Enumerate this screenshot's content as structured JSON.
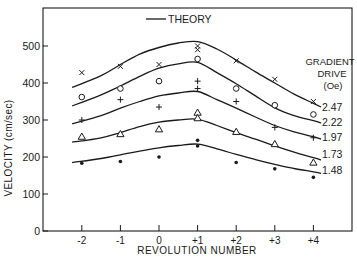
{
  "chart_data": {
    "type": "line",
    "title": "",
    "xlabel": "REVOLUTION NUMBER",
    "ylabel": "VELOCITY (cm/sec)",
    "x": [
      -2,
      -1,
      0,
      1,
      2,
      3,
      4
    ],
    "x_tick_labels": [
      "-2",
      "-1",
      "0",
      "+1",
      "+2",
      "+3",
      "+4"
    ],
    "y_ticks": [
      0,
      100,
      200,
      300,
      400,
      500
    ],
    "y_tick_labels": [
      "0",
      "100",
      "200",
      "300",
      "400",
      "500"
    ],
    "ylim": [
      0,
      590
    ],
    "xlim": [
      -3,
      5
    ],
    "grid": false,
    "legend": {
      "position": "top-center",
      "entries": [
        "THEORY"
      ],
      "series_label_title": [
        "GRADIENT",
        "DRIVE",
        "(Oe)"
      ]
    },
    "series": [
      {
        "name": "2.47",
        "marker": "x",
        "measured": [
          [
            -2,
            428
          ],
          [
            -1,
            445
          ],
          [
            0,
            450
          ],
          [
            1,
            500
          ],
          [
            1,
            490
          ],
          [
            2,
            460
          ],
          [
            3,
            410
          ],
          [
            4,
            350
          ]
        ],
        "theory_x": [
          -2.25,
          -1.5,
          -1,
          -0.5,
          0,
          0.5,
          1,
          1.5,
          2,
          2.5,
          3,
          3.5,
          4,
          4.2
        ],
        "theory_y": [
          388,
          420,
          450,
          478,
          496,
          508,
          512,
          492,
          462,
          430,
          400,
          370,
          345,
          335
        ]
      },
      {
        "name": "2.22",
        "marker": "o",
        "measured": [
          [
            -2,
            362
          ],
          [
            -1,
            385
          ],
          [
            0,
            405
          ],
          [
            1,
            465
          ],
          [
            2,
            385
          ],
          [
            3,
            340
          ],
          [
            4,
            315
          ]
        ],
        "theory_x": [
          -2.25,
          -1.5,
          -1,
          -0.5,
          0,
          0.5,
          1,
          1.5,
          2,
          2.5,
          3,
          3.5,
          4,
          4.2
        ],
        "theory_y": [
          338,
          368,
          392,
          418,
          440,
          452,
          456,
          428,
          398,
          365,
          333,
          312,
          298,
          292
        ]
      },
      {
        "name": "1.97",
        "marker": "+",
        "measured": [
          [
            -2,
            300
          ],
          [
            -1,
            355
          ],
          [
            0,
            335
          ],
          [
            1,
            405
          ],
          [
            1,
            385
          ],
          [
            2,
            350
          ],
          [
            3,
            280
          ],
          [
            4,
            252
          ]
        ],
        "theory_x": [
          -2.25,
          -1.5,
          -1,
          -0.5,
          0,
          0.5,
          1,
          1.5,
          2,
          2.5,
          3,
          3.5,
          4,
          4.2
        ],
        "theory_y": [
          290,
          312,
          332,
          350,
          365,
          373,
          377,
          355,
          332,
          308,
          285,
          268,
          255,
          248
        ]
      },
      {
        "name": "1.73",
        "marker": "triangle",
        "measured": [
          [
            -2,
            255
          ],
          [
            -1,
            262
          ],
          [
            0,
            275
          ],
          [
            1,
            320
          ],
          [
            1,
            305
          ],
          [
            2,
            268
          ],
          [
            3,
            235
          ],
          [
            4,
            185
          ]
        ],
        "theory_x": [
          -2.25,
          -1.5,
          -1,
          -0.5,
          0,
          0.5,
          1,
          1.5,
          2,
          2.5,
          3,
          3.5,
          4,
          4.2
        ],
        "theory_y": [
          240,
          252,
          266,
          282,
          294,
          300,
          302,
          285,
          266,
          248,
          230,
          213,
          198,
          192
        ]
      },
      {
        "name": "1.48",
        "marker": "dot",
        "measured": [
          [
            -2,
            183
          ],
          [
            -1,
            188
          ],
          [
            0,
            200
          ],
          [
            1,
            245
          ],
          [
            1,
            230
          ],
          [
            2,
            185
          ],
          [
            3,
            168
          ],
          [
            4,
            145
          ]
        ],
        "theory_x": [
          -2.25,
          -1.5,
          -1,
          -0.5,
          0,
          0.5,
          1,
          1.5,
          2,
          2.5,
          3,
          3.5,
          4,
          4.2
        ],
        "theory_y": [
          185,
          196,
          206,
          216,
          225,
          231,
          235,
          222,
          207,
          193,
          180,
          169,
          160,
          156
        ]
      }
    ]
  },
  "labels": {
    "legend_theory": "THEORY",
    "gradient_title_1": "GRADIENT",
    "gradient_title_2": "DRIVE",
    "gradient_title_3": "(Oe)",
    "xlabel": "REVOLUTION NUMBER",
    "ylabel": "VELOCITY (cm/sec)"
  },
  "style": {
    "ink": "#1a1a1a",
    "background": "#ffffff"
  }
}
